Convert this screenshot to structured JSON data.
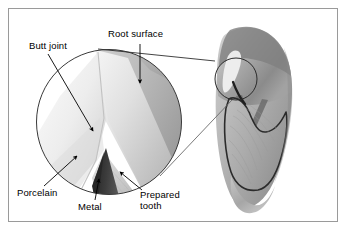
{
  "figure": {
    "background_color": "#ffffff",
    "frame_color": "#9a9a9a",
    "label_color": "#000000"
  },
  "labels": {
    "butt_joint": "Butt joint",
    "root_surface": "Root surface",
    "porcelain": "Porcelain",
    "metal": "Metal",
    "prepared_tooth_line1": "Prepared",
    "prepared_tooth_line2": "tooth"
  },
  "diagram": {
    "magnifier": {
      "name": "magnified-detail-circle",
      "cx": 109,
      "cy": 122,
      "r": 73
    },
    "callout": {
      "name": "detail-source-circle",
      "cx": 236,
      "cy": 79,
      "r": 21
    },
    "tooth": {
      "name": "tooth-cross-section",
      "crown_color": "#b9b9b9",
      "root_color": "#a8a8a8",
      "outline_color": "#2b2b2b"
    },
    "materials": {
      "metal_color": "#3a3a3a",
      "porcelain_color": "#e8e8e8",
      "dentin_color": "#c9c9c9"
    }
  }
}
